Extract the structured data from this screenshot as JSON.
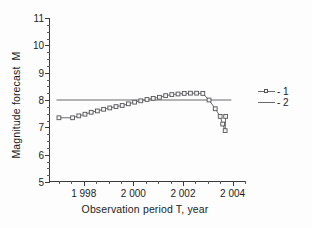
{
  "chart_data": {
    "type": "line",
    "title": "",
    "xlabel": "Observation period T, year",
    "ylabel": "Magnitude forecast  M",
    "xlim": [
      1996.6,
      2004.5
    ],
    "ylim": [
      5,
      11
    ],
    "grid": false,
    "legend_position": "right",
    "xticks": [
      1998,
      2000,
      2002,
      2004
    ],
    "xtick_labels": [
      "1 998",
      "2 000",
      "2 002",
      "2 004"
    ],
    "xminor_step": 0.5,
    "yticks": [
      5,
      6,
      7,
      8,
      9,
      10,
      11
    ],
    "ytick_labels": [
      "5",
      "6",
      "7",
      "8",
      "9",
      "10",
      "11"
    ],
    "yminor_step": 0.25,
    "series": [
      {
        "name": "1",
        "legend_label": "- 1",
        "style": "line-with-open-square-markers",
        "color": "#6b6b6b",
        "marker_edge_color": "#55555a",
        "marker_face_color": "#f4f4f4",
        "x": [
          1997.0,
          1997.55,
          1997.8,
          1998.05,
          1998.3,
          1998.55,
          1998.8,
          1999.05,
          1999.3,
          1999.55,
          1999.8,
          2000.05,
          2000.3,
          2000.55,
          2000.8,
          2001.05,
          2001.3,
          2001.55,
          2001.8,
          2002.05,
          2002.3,
          2002.55,
          2002.8,
          2003.05,
          2003.3,
          2003.5,
          2003.6,
          2003.7,
          2003.72
        ],
        "y": [
          7.35,
          7.35,
          7.42,
          7.48,
          7.55,
          7.6,
          7.66,
          7.71,
          7.76,
          7.8,
          7.86,
          7.92,
          7.97,
          8.02,
          8.06,
          8.1,
          8.16,
          8.2,
          8.22,
          8.24,
          8.25,
          8.25,
          8.24,
          8.0,
          7.68,
          7.4,
          7.12,
          6.88,
          7.4
        ]
      },
      {
        "name": "2",
        "legend_label": "- 2",
        "style": "plain-horizontal-line",
        "color": "#6b6b6b",
        "constant_y": 8.0,
        "x": [
          1996.9,
          2003.95
        ],
        "y": [
          8.0,
          8.0
        ]
      }
    ]
  }
}
